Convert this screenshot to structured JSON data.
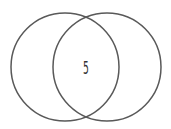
{
  "diagram": {
    "type": "venn",
    "sets": [
      {
        "name": "",
        "cx": 65,
        "cy": 67,
        "r": 54
      },
      {
        "name": "",
        "cx": 107,
        "cy": 67,
        "r": 54
      }
    ],
    "regions": [
      {
        "sets": [
          0,
          1
        ],
        "label": "5",
        "x": 86,
        "y": 68
      }
    ],
    "stroke_color": "#595959",
    "label_color": "#333333"
  }
}
